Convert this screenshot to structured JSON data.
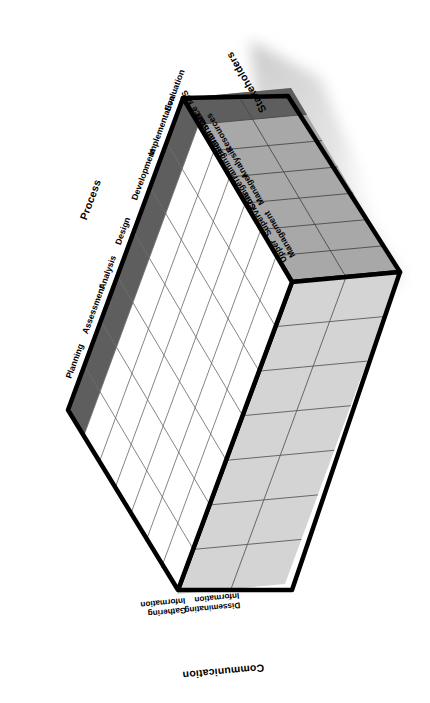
{
  "diagram": {
    "title_axes": {
      "stakeholders": "Stakeholders",
      "process": "Process",
      "communication": "Communication"
    },
    "colors": {
      "outline": "#000000",
      "front_face": "#ffffff",
      "front_edge_band": "#5e5e5e",
      "top_face": "#a8a8a8",
      "top_face_band": "#5e5e5e",
      "right_face": "#d4d4d4",
      "grid_line": "#6f6f6f",
      "shadow": "#cfcfcf",
      "text": "#000000"
    },
    "stakeholders": [
      "MIS",
      "Staff",
      "Human Resources",
      "Training/Performance Analysis",
      "Change Manager",
      "Supervisors",
      "Upper Management"
    ],
    "process": [
      "Evaluation",
      "Implementation",
      "Development",
      "Design",
      "Analysis",
      "Assessment",
      "Planning"
    ],
    "communication": [
      "Gathering Information",
      "Disseminating Information"
    ],
    "counts": {
      "stakeholders": 7,
      "process": 7,
      "communication": 2
    }
  }
}
